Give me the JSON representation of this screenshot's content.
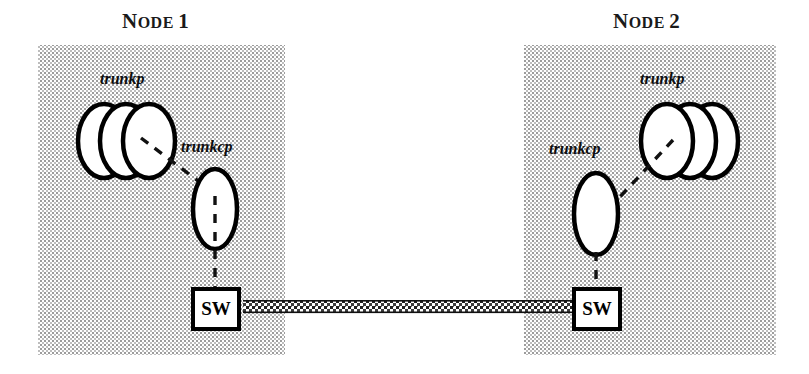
{
  "figure": {
    "title_left": {
      "first_letter": "N",
      "small_caps": "ODE",
      "number": "1",
      "full": "NODE 1"
    },
    "title_right": {
      "first_letter": "N",
      "small_caps": "ODE",
      "number": "2",
      "full": "NODE 2"
    },
    "colors": {
      "background": "#ffffff",
      "node_box_fill": "#d9d9d9",
      "stroke": "#000000",
      "shape_fill": "#ffffff",
      "text": "#000000",
      "link": "#1a1a1a"
    },
    "nodes": [
      {
        "id": "node-1",
        "title": "NODE 1",
        "trunkp_label": "trunkp",
        "trunkcp_label": "trunkcp",
        "switch_label": "SW",
        "trunkp_count": 3
      },
      {
        "id": "node-2",
        "title": "NODE 2",
        "trunkp_label": "trunkp",
        "trunkcp_label": "trunkcp",
        "switch_label": "SW",
        "trunkp_count": 3
      }
    ],
    "link": {
      "name": "inter-node-trunk-link",
      "style": "thick-hatched-band"
    }
  }
}
